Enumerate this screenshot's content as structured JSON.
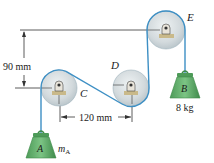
{
  "diagram": {
    "type": "pulley-system",
    "pulleys": [
      {
        "id": "C",
        "label": "C"
      },
      {
        "id": "D",
        "label": "D"
      },
      {
        "id": "E",
        "label": "E"
      }
    ],
    "dimensions": {
      "vertical": "90 mm",
      "horizontal": "120 mm"
    },
    "weights": {
      "A": {
        "label": "A",
        "mass_label": "m",
        "mass_sub": "A"
      },
      "B": {
        "label": "B",
        "mass_label": "8 kg"
      }
    },
    "colors": {
      "cable": "#3d8fc4",
      "pulley_fill": "#d7dde0",
      "pulley_edge": "#9fb3bd",
      "weight_fill": "#5fae6a",
      "weight_dark": "#3c8a48",
      "bracket": "#c9b98a",
      "line": "#333333"
    }
  }
}
